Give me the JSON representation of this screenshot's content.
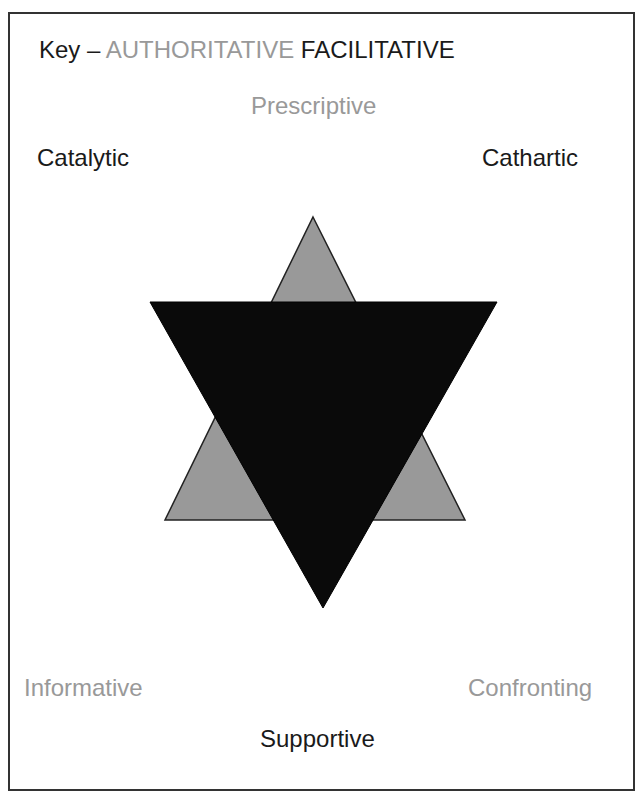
{
  "key": {
    "prefix": "Key –",
    "authoritative": "AUTHORITATIVE",
    "facilitative": "FACILITATIVE"
  },
  "labels": {
    "prescriptive": "Prescriptive",
    "catalytic": "Catalytic",
    "cathartic": "Cathartic",
    "informative": "Informative",
    "confronting": "Confronting",
    "supportive": "Supportive"
  },
  "colors": {
    "authoritative": "#999999",
    "facilitative": "#1a1a1a",
    "grey_triangle": "#999999",
    "black_triangle": "#0a0a0a",
    "border": "#333333"
  },
  "shapes": {
    "grey_triangle": "Upward triangle (authoritative)",
    "black_triangle": "Downward triangle (facilitative)"
  }
}
